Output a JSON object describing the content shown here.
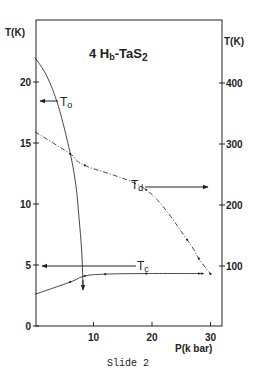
{
  "chart_data": {
    "type": "line",
    "title": "4 Hb-TaS2",
    "xlabel": "P(k bar)",
    "ylabel_left": "T(K)",
    "ylabel_right": "T(K)",
    "xlim": [
      0,
      32
    ],
    "ylim_left": [
      0,
      24
    ],
    "ylim_right": [
      50,
      500
    ],
    "x_ticks": [
      10,
      20,
      30
    ],
    "y_ticks_left": [
      0,
      5,
      10,
      15,
      20
    ],
    "y_ticks_right": [
      100,
      200,
      300,
      400
    ],
    "grid": false,
    "series": [
      {
        "name": "To",
        "axis": "left",
        "style": "solid",
        "x": [
          0,
          2,
          4,
          6,
          7,
          7.5,
          8,
          8.2
        ],
        "y": [
          22,
          20.5,
          18,
          14.2,
          11.5,
          9,
          6,
          3.2
        ],
        "annotation_arrow": "left-axis",
        "end_arrow": "down"
      },
      {
        "name": "Td",
        "axis": "right",
        "style": "dash-dot",
        "x": [
          0,
          6,
          8.5,
          19,
          26,
          28,
          30
        ],
        "y": [
          320,
          284,
          265,
          225,
          143,
          112,
          87
        ],
        "annotation_arrow": "right-axis"
      },
      {
        "name": "Tc",
        "axis": "left",
        "style": "solid",
        "x": [
          0,
          6,
          8.5,
          12,
          19,
          28,
          28.5
        ],
        "y": [
          2.6,
          3.6,
          4.1,
          4.25,
          4.3,
          4.3,
          4.3
        ],
        "annotation_arrow": "left-axis"
      }
    ]
  },
  "labels": {
    "title_prefix": "4 H",
    "title_sub": "b",
    "title_mid": "-TaS",
    "title_sub2": "2",
    "left_axis": "T(K)",
    "right_axis": "T(K)",
    "x_axis": "P(k bar)",
    "to_main": "T",
    "to_sub": "o",
    "td_main": "T",
    "td_sub": "d",
    "tc_main": "T",
    "tc_sub": "c",
    "caption": "Slide 2"
  }
}
